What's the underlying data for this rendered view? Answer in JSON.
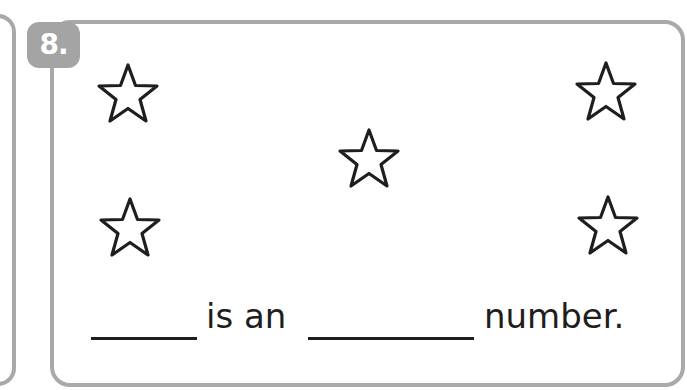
{
  "exercise": {
    "number_label": "8.",
    "star_count": 5,
    "stars": [
      {
        "position": "top-left",
        "icon": "star-outline-icon"
      },
      {
        "position": "top-right",
        "icon": "star-outline-icon"
      },
      {
        "position": "center",
        "icon": "star-outline-icon"
      },
      {
        "position": "bottom-left",
        "icon": "star-outline-icon"
      },
      {
        "position": "bottom-right",
        "icon": "star-outline-icon"
      }
    ],
    "sentence": {
      "blank_1": "",
      "part_1": "is an",
      "blank_2": "",
      "part_2": "number."
    }
  },
  "colors": {
    "border": "#a9a9a9",
    "badge": "#a4a4a4",
    "text": "#1e1e1e"
  }
}
